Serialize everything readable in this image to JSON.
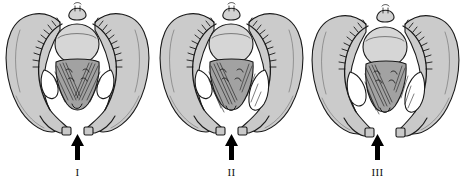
{
  "figure": {
    "type": "anatomical-illustration",
    "background_color": "#ffffff",
    "line_color": "#1a1a1a",
    "bone_fill_color": "#cccccc",
    "muscle_fill_color": "#9a9a9a",
    "foramen_fill_color": "#ffffff",
    "panel_count": 3
  },
  "panels": [
    {
      "id": "panel-1",
      "caption": "I",
      "arrow": {
        "icon": "arrow-up-icon",
        "direction": "up",
        "color": "#000000",
        "offset_x": 0
      },
      "description": "Pelvis with fetal head centered; pubic symphysis narrowly separated"
    },
    {
      "id": "panel-2",
      "caption": "II",
      "arrow": {
        "icon": "arrow-up-icon",
        "direction": "up",
        "color": "#000000",
        "offset_x": 0
      },
      "description": "Pelvis with fetal head rotated; muscle shading shifted to the left side"
    },
    {
      "id": "panel-3",
      "caption": "III",
      "arrow": {
        "icon": "arrow-up-icon",
        "direction": "up",
        "color": "#000000",
        "offset_x": -8
      },
      "description": "Pelvis with fetal head displaced; widened symphyseal gap"
    }
  ]
}
